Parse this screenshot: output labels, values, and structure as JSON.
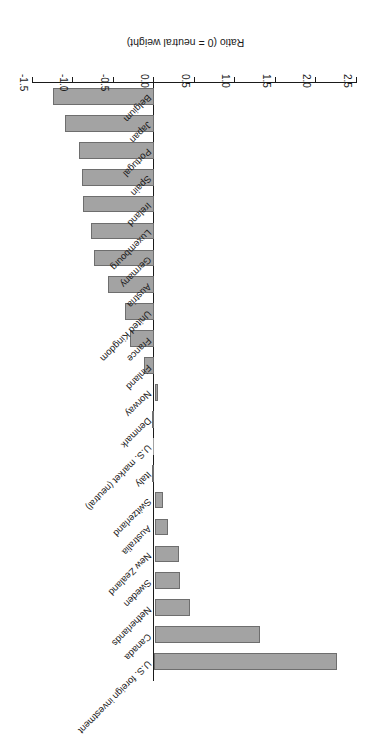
{
  "chart_data": {
    "type": "bar",
    "orientation": "horizontal",
    "title": "",
    "xlabel": "Ratio (0 = neutral weight)",
    "ylabel": "",
    "xlim": [
      -1.5,
      2.5
    ],
    "xticks": [
      2.5,
      2.0,
      1.5,
      1.0,
      0.5,
      0.0,
      -0.5,
      -1.0,
      -1.5
    ],
    "xticklabels": [
      "2.5",
      "2.0",
      "1.5",
      "1.0",
      "0.5",
      "0.0",
      "-0.5",
      "-1.0",
      "-1.5"
    ],
    "grid": false,
    "legend": false,
    "bar_color": "#a3a3a3",
    "bar_edge_color": "#6e6e6e",
    "axis_color": "#1a1a1a",
    "rotation_note": "figure rendered upside-down (180 degrees) as in source scan",
    "categories": [
      "U.S. foreign investment",
      "Canada",
      "Netherlands",
      "Sweden",
      "New Zealand",
      "Australia",
      "Switzerland",
      "Italy",
      "U.S. market (neutral)",
      "Denmark",
      "Norway",
      "Finland",
      "France",
      "United Kingdom",
      "Austria",
      "Germany",
      "Luxembourg",
      "Ireland",
      "Spain",
      "Portugal",
      "Japan",
      "Belgium"
    ],
    "values": [
      2.25,
      1.3,
      0.44,
      0.32,
      0.3,
      0.17,
      0.11,
      -0.02,
      0.0,
      -0.01,
      0.04,
      -0.13,
      -0.3,
      -0.37,
      -0.57,
      -0.75,
      -0.79,
      -0.88,
      -0.89,
      -0.93,
      -1.11,
      -1.25
    ]
  },
  "axis": {
    "title": "Ratio (0 = neutral weight)"
  }
}
